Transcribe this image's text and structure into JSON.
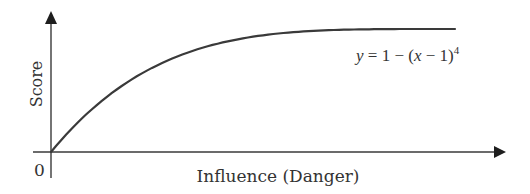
{
  "chart_data": {
    "type": "line",
    "title": "",
    "xlabel": "Influence (Danger)",
    "ylabel": "Score",
    "origin_label": "0",
    "annotation": {
      "text_y": "y",
      "text_eq": " = 1 − (",
      "text_x": "x",
      "text_rest": " − 1)",
      "text_exp": "4",
      "full": "y = 1 − (x − 1)^4"
    },
    "function": "y = 1 - (x - 1)^4",
    "x_range": [
      0,
      1
    ],
    "y_range": [
      0,
      1
    ],
    "grid": false,
    "legend": "none",
    "series": [
      {
        "name": "y = 1 - (x - 1)^4",
        "x": [
          0,
          0.1,
          0.2,
          0.3,
          0.4,
          0.5,
          0.6,
          0.7,
          0.8,
          0.9,
          1.0
        ],
        "values": [
          0,
          0.344,
          0.59,
          0.76,
          0.87,
          0.938,
          0.974,
          0.992,
          0.998,
          1.0,
          1.0
        ]
      }
    ]
  },
  "colors": {
    "line": "#3a3a3a",
    "text": "#333333",
    "background": "#ffffff"
  }
}
